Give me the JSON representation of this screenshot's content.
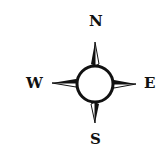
{
  "compass": {
    "directions": {
      "north": "N",
      "south": "S",
      "east": "E",
      "west": "W"
    },
    "colors": {
      "ink": "#111111",
      "background": "#ffffff"
    }
  }
}
